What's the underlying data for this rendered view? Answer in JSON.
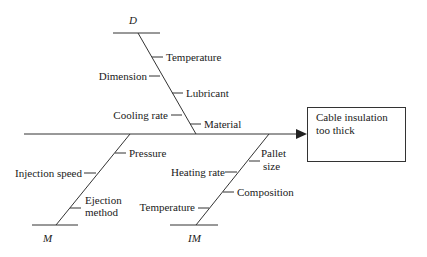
{
  "diagram": {
    "type": "fishbone",
    "effect": {
      "line1": "Cable insulation",
      "line2": "too thick"
    },
    "categories": [
      {
        "key": "D",
        "label": "D",
        "causes": [
          "Temperature",
          "Dimension",
          "Lubricant",
          "Cooling rate",
          "Material"
        ]
      },
      {
        "key": "M",
        "label": "M",
        "causes": [
          "Pressure",
          "Injection speed",
          "Ejection method"
        ]
      },
      {
        "key": "IM",
        "label": "IM",
        "causes": [
          "Pallet size",
          "Heating rate",
          "Composition",
          "Temperature"
        ]
      }
    ],
    "labels": {
      "d": {
        "title": "D",
        "temperature": "Temperature",
        "dimension": "Dimension",
        "lubricant": "Lubricant",
        "cooling_rate": "Cooling rate",
        "material": "Material"
      },
      "m": {
        "title": "M",
        "pressure": "Pressure",
        "injection_speed": "Injection speed",
        "ejection_1": "Ejection",
        "ejection_2": "method"
      },
      "im": {
        "title": "IM",
        "pallet_1": "Pallet",
        "pallet_2": "size",
        "heating_rate": "Heating rate",
        "composition": "Composition",
        "temperature": "Temperature"
      }
    },
    "colors": {
      "line": "#333333",
      "text": "#1a1a1a",
      "background": "#ffffff"
    }
  }
}
